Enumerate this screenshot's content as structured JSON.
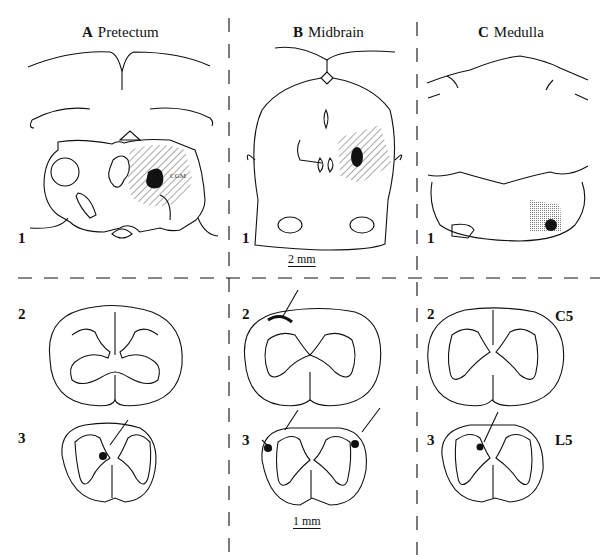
{
  "figure": {
    "columns": [
      {
        "letter": "A",
        "title": "Pretectum"
      },
      {
        "letter": "B",
        "title": "Midbrain"
      },
      {
        "letter": "C",
        "title": "Medulla"
      }
    ],
    "row_labels": {
      "brain": "1",
      "upper_cord": "2",
      "lower_cord": "3"
    },
    "segment_labels": {
      "cervical": "C5",
      "lumbar": "L5"
    },
    "scale_bars": {
      "brain": "2 mm",
      "spinal_cord": "1 mm"
    },
    "annotations": {
      "lesion_region": "CGM"
    },
    "colors": {
      "ink": "#111111",
      "background": "#ffffff",
      "hatch": "#555555"
    }
  }
}
